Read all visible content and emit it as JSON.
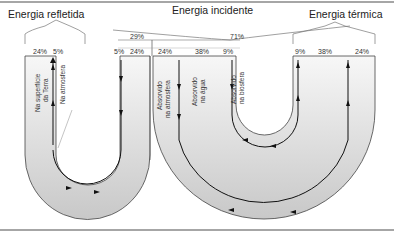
{
  "diagram": {
    "headers": {
      "reflected": "Energia refletida",
      "incident": "Energia incidente",
      "thermal": "Energia térmica"
    },
    "incident_split": {
      "left": "29%",
      "right": "71%"
    },
    "reflected_columns": [
      "24%",
      "5%"
    ],
    "incident_columns": [
      "5%",
      "24%",
      "24%",
      "38%",
      "9%"
    ],
    "thermal_columns": [
      "9%",
      "38%",
      "24%"
    ],
    "vertical_labels": {
      "surface_line1": "Na superfície",
      "surface_line2": "da Terra",
      "atmosphere": "Na atmosfera",
      "abs_atm_line1": "Absorvido",
      "abs_atm_line2": "na atmosfera",
      "abs_water_line1": "Absorvido",
      "abs_water_line2": "na água",
      "abs_bio_line1": "Absorvido",
      "abs_bio_line2": "na biosfera"
    },
    "colors": {
      "band_fill": "#d4d4d4",
      "band_light": "#f2f2f2",
      "line": "#222222"
    }
  }
}
